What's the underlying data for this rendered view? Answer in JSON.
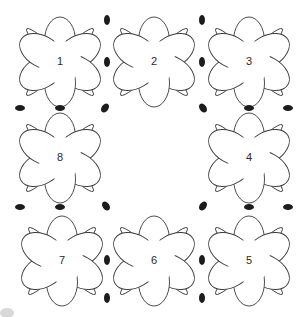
{
  "diagram": {
    "type": "crochet-motif-assembly-diagram",
    "canvas": {
      "width": 307,
      "height": 317,
      "background": "#ffffff"
    },
    "style": {
      "outline_color": "#3a3a3a",
      "fill_color": "#ffffff",
      "bead_color": "#1c1c1c",
      "label_color": "#2a2a2a",
      "outline_width": 0.9
    },
    "grid": {
      "columns": 3,
      "rows": 3,
      "center_cell": "empty",
      "column_centers": [
        60,
        154,
        249
      ],
      "row_centers": [
        62,
        158,
        261
      ]
    },
    "motifs": [
      {
        "id": "m1",
        "label": "1",
        "cx": 60,
        "cy": 62,
        "row": 0,
        "col": 0,
        "petals": 6,
        "leaves": 4
      },
      {
        "id": "m2",
        "label": "2",
        "cx": 154,
        "cy": 62,
        "row": 0,
        "col": 1,
        "petals": 6,
        "leaves": 4
      },
      {
        "id": "m3",
        "label": "3",
        "cx": 249,
        "cy": 62,
        "row": 0,
        "col": 2,
        "petals": 6,
        "leaves": 4
      },
      {
        "id": "m8",
        "label": "8",
        "cx": 60,
        "cy": 158,
        "row": 1,
        "col": 0,
        "petals": 6,
        "leaves": 4
      },
      {
        "id": "m4",
        "label": "4",
        "cx": 249,
        "cy": 158,
        "row": 1,
        "col": 2,
        "petals": 6,
        "leaves": 4
      },
      {
        "id": "m7",
        "label": "7",
        "cx": 62,
        "cy": 261,
        "row": 2,
        "col": 0,
        "petals": 6,
        "leaves": 4
      },
      {
        "id": "m6",
        "label": "6",
        "cx": 154,
        "cy": 261,
        "row": 2,
        "col": 1,
        "petals": 6,
        "leaves": 4
      },
      {
        "id": "m5",
        "label": "5",
        "cx": 249,
        "cy": 261,
        "row": 2,
        "col": 2,
        "petals": 6,
        "leaves": 4
      }
    ],
    "beads": [
      {
        "cx": 107,
        "cy": 20,
        "rx": 3.0,
        "ry": 5.0,
        "rot": 0
      },
      {
        "cx": 107,
        "cy": 62,
        "rx": 3.0,
        "ry": 5.0,
        "rot": 0
      },
      {
        "cx": 202,
        "cy": 20,
        "rx": 3.0,
        "ry": 5.0,
        "rot": 0
      },
      {
        "cx": 202,
        "cy": 62,
        "rx": 3.0,
        "ry": 5.0,
        "rot": 0
      },
      {
        "cx": 20,
        "cy": 108,
        "rx": 5.0,
        "ry": 3.0,
        "rot": 0
      },
      {
        "cx": 60,
        "cy": 108,
        "rx": 5.0,
        "ry": 3.0,
        "rot": 0
      },
      {
        "cx": 105,
        "cy": 108,
        "rx": 3.4,
        "ry": 5.0,
        "rot": 35
      },
      {
        "cx": 203,
        "cy": 108,
        "rx": 3.4,
        "ry": 5.0,
        "rot": -35
      },
      {
        "cx": 249,
        "cy": 108,
        "rx": 5.0,
        "ry": 3.0,
        "rot": 0
      },
      {
        "cx": 288,
        "cy": 108,
        "rx": 5.0,
        "ry": 3.0,
        "rot": 0
      },
      {
        "cx": 20,
        "cy": 207,
        "rx": 5.0,
        "ry": 3.0,
        "rot": 0
      },
      {
        "cx": 60,
        "cy": 207,
        "rx": 5.0,
        "ry": 3.0,
        "rot": 0
      },
      {
        "cx": 106,
        "cy": 206,
        "rx": 3.4,
        "ry": 5.0,
        "rot": -35
      },
      {
        "cx": 203,
        "cy": 206,
        "rx": 3.4,
        "ry": 5.0,
        "rot": 35
      },
      {
        "cx": 249,
        "cy": 207,
        "rx": 5.0,
        "ry": 3.0,
        "rot": 0
      },
      {
        "cx": 288,
        "cy": 207,
        "rx": 5.0,
        "ry": 3.0,
        "rot": 0
      },
      {
        "cx": 107,
        "cy": 260,
        "rx": 3.0,
        "ry": 5.0,
        "rot": 0
      },
      {
        "cx": 107,
        "cy": 298,
        "rx": 3.0,
        "ry": 5.0,
        "rot": 0
      },
      {
        "cx": 202,
        "cy": 260,
        "rx": 3.0,
        "ry": 5.0,
        "rot": 0
      },
      {
        "cx": 202,
        "cy": 298,
        "rx": 3.0,
        "ry": 5.0,
        "rot": 0
      }
    ],
    "artifact": {
      "present": true,
      "cx": 7,
      "cy": 313,
      "rx": 7,
      "ry": 5,
      "note": "scan smudge"
    }
  }
}
